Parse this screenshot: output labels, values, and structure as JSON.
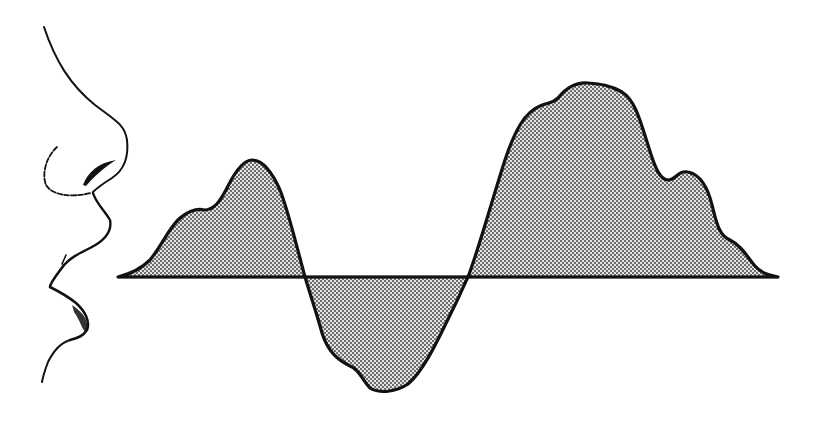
{
  "figure": {
    "colors": {
      "background": "#ffffff",
      "ink": "#111111",
      "stipple_dot": "#3a3a3a",
      "stipple_bg": "#e4e4e4"
    },
    "baseline": {
      "y": 277,
      "x_start": 118,
      "x_end": 778
    },
    "zero_crossings_x": [
      305,
      468
    ],
    "lobes": [
      {
        "name": "positive-lobe-1",
        "x_range": [
          118,
          305
        ],
        "peak": {
          "x": 250,
          "y": 160
        },
        "shoulder": {
          "x": 200,
          "y": 210
        }
      },
      {
        "name": "negative-lobe",
        "x_range": [
          305,
          468
        ],
        "trough": {
          "x": 370,
          "y": 390
        }
      },
      {
        "name": "positive-lobe-2",
        "x_range": [
          468,
          778
        ],
        "peak": {
          "x": 585,
          "y": 82
        },
        "shoulders": [
          {
            "x": 540,
            "y": 105
          },
          {
            "x": 685,
            "y": 172
          },
          {
            "x": 735,
            "y": 240
          }
        ]
      }
    ]
  }
}
